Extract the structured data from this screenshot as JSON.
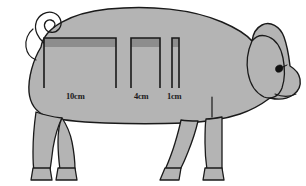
{
  "figure": {
    "colors": {
      "body_fill": "#b4b4b4",
      "body_outline": "#1a1a1a",
      "bracket_band": "#8d8d8d",
      "bracket_line": "#1a1a1a",
      "background": "#ffffff",
      "eye": "#111111"
    }
  },
  "measurements": [
    {
      "label": "10cm",
      "name": "measurement-bracket-10cm",
      "x": 44,
      "y": 38,
      "width": 72,
      "height": 50,
      "band_height": 9
    },
    {
      "label": "4cm",
      "name": "measurement-bracket-4cm",
      "x": 131,
      "y": 38,
      "width": 29,
      "height": 50,
      "band_height": 9
    },
    {
      "label": "1cm",
      "name": "measurement-bracket-1cm",
      "x": 172,
      "y": 38,
      "width": 7,
      "height": 50,
      "band_height": 9
    }
  ],
  "chart_data": {
    "type": "diagram",
    "categories": [
      "10cm",
      "4cm",
      "1cm"
    ],
    "values": [
      10,
      4,
      1
    ],
    "unit": "cm",
    "xlabel": "",
    "ylabel": "",
    "annotations": [
      "10cm",
      "4cm",
      "1cm"
    ],
    "legend": []
  }
}
